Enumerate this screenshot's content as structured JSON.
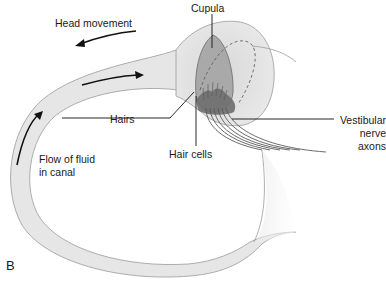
{
  "figure": {
    "panel_letter": "B",
    "labels": {
      "head_movement": "Head movement",
      "cupula": "Cupula",
      "hairs": "Hairs",
      "hair_cells": "Hair cells",
      "vestibular_line1": "Vestibular",
      "vestibular_line2": "nerve",
      "vestibular_line3": "axons",
      "flow_line1": "Flow of fluid",
      "flow_line2": "in canal"
    },
    "colors": {
      "canal_fill": "#e6e6e6",
      "canal_stroke": "#8a8a8a",
      "ampulla_fill": "#dcdcdc",
      "cupula_fill": "#a8a8a8",
      "hair_cells_fill": "#6e6e6e",
      "arrow": "#111111"
    }
  }
}
